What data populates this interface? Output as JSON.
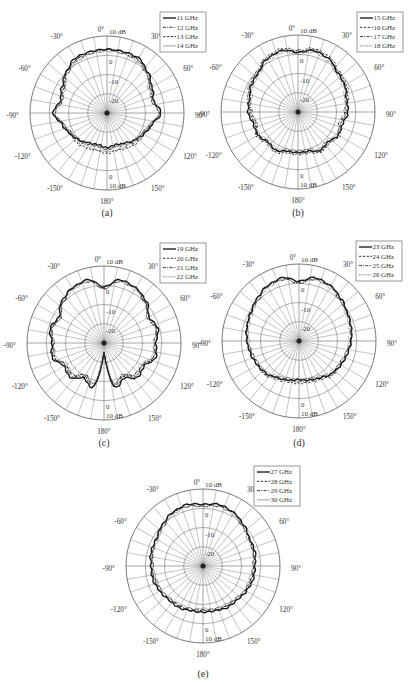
{
  "figure": {
    "panels": [
      "a",
      "b",
      "c",
      "d",
      "e"
    ]
  },
  "chart_data": [
    {
      "type": "polar-line",
      "panel": "(a)",
      "title": "",
      "radial_unit": "dB",
      "radial_ticks": [
        "-20",
        "-10",
        "0",
        "10 dB"
      ],
      "radial_range": [
        -30,
        10
      ],
      "angle_labels": [
        "0°",
        "30°",
        "60°",
        "90°",
        "120°",
        "150°",
        "180°",
        "-150°",
        "-120°",
        "-90°",
        "-60°",
        "-30°"
      ],
      "legend_position": "top-right",
      "angles_deg": [
        0,
        15,
        30,
        45,
        60,
        75,
        90,
        105,
        120,
        135,
        150,
        165,
        180,
        195,
        210,
        225,
        240,
        255,
        270,
        285,
        300,
        315,
        330,
        345
      ],
      "series": [
        {
          "name": "11 GHz",
          "style": "solid",
          "values": [
            3,
            3,
            3,
            0,
            -3,
            -5,
            -2,
            -6,
            -8,
            -10,
            -12,
            -13,
            -12,
            -13,
            -12,
            -10,
            -8,
            -6,
            -2,
            -5,
            -3,
            0,
            3,
            3
          ]
        },
        {
          "name": "12 GHz",
          "style": "dashdot",
          "values": [
            3,
            3,
            2,
            0,
            -4,
            -5,
            -2,
            -7,
            -9,
            -9,
            -11,
            -12,
            -11,
            -12,
            -11,
            -9,
            -9,
            -7,
            -2,
            -5,
            -4,
            0,
            2,
            3
          ]
        },
        {
          "name": "13 GHz",
          "style": "dashed",
          "values": [
            3,
            2,
            2,
            -1,
            -4,
            -6,
            -3,
            -6,
            -8,
            -8,
            -9,
            -10,
            -9,
            -10,
            -9,
            -8,
            -8,
            -6,
            -3,
            -6,
            -4,
            -1,
            2,
            2
          ]
        },
        {
          "name": "14 GHz",
          "style": "thin",
          "values": [
            2,
            2,
            1,
            -1,
            -5,
            -6,
            -3,
            -7,
            -9,
            -10,
            -12,
            -12,
            -11,
            -12,
            -12,
            -10,
            -9,
            -7,
            -3,
            -6,
            -5,
            -1,
            1,
            2
          ]
        }
      ]
    },
    {
      "type": "polar-line",
      "panel": "(b)",
      "radial_unit": "dB",
      "radial_ticks": [
        "-20",
        "-10",
        "0",
        "10 dB"
      ],
      "radial_range": [
        -30,
        10
      ],
      "angle_labels": [
        "0°",
        "30°",
        "60°",
        "90°",
        "120°",
        "150°",
        "180°",
        "-150°",
        "-120°",
        "-90°",
        "-60°",
        "-30°"
      ],
      "legend_position": "top-right",
      "angles_deg": [
        0,
        15,
        30,
        45,
        60,
        75,
        90,
        105,
        120,
        135,
        150,
        165,
        180,
        195,
        210,
        225,
        240,
        255,
        270,
        285,
        300,
        315,
        330,
        345
      ],
      "series": [
        {
          "name": "15 GHz",
          "style": "solid",
          "values": [
            1,
            3,
            2,
            -1,
            -2,
            -4,
            -4,
            -6,
            -6,
            -8,
            -7,
            -9,
            -9,
            -9,
            -7,
            -8,
            -6,
            -6,
            -4,
            -4,
            -2,
            -1,
            2,
            3
          ]
        },
        {
          "name": "16 GHz",
          "style": "dashed",
          "values": [
            2,
            4,
            3,
            0,
            -1,
            -3,
            -5,
            -7,
            -5,
            -7,
            -6,
            -8,
            -8,
            -8,
            -6,
            -7,
            -5,
            -7,
            -5,
            -3,
            -1,
            0,
            3,
            4
          ]
        },
        {
          "name": "17 GHz",
          "style": "dashdot",
          "values": [
            1,
            3,
            2,
            -1,
            -2,
            -4,
            -6,
            -8,
            -6,
            -8,
            -7,
            -9,
            -9,
            -9,
            -7,
            -8,
            -6,
            -8,
            -6,
            -4,
            -2,
            -1,
            2,
            3
          ]
        },
        {
          "name": "18 GHz",
          "style": "dotted",
          "values": [
            0,
            2,
            1,
            -2,
            -3,
            -5,
            -5,
            -7,
            -7,
            -9,
            -8,
            -10,
            -10,
            -10,
            -8,
            -9,
            -7,
            -7,
            -5,
            -5,
            -3,
            -2,
            1,
            2
          ]
        }
      ]
    },
    {
      "type": "polar-line",
      "panel": "(c)",
      "radial_unit": "dB",
      "radial_ticks": [
        "-20",
        "-10",
        "0",
        "10 dB"
      ],
      "radial_range": [
        -30,
        10
      ],
      "angle_labels": [
        "0°",
        "30°",
        "60°",
        "90°",
        "120°",
        "150°",
        "180°",
        "-150°",
        "-120°",
        "-90°",
        "-60°",
        "-30°"
      ],
      "legend_position": "top-right",
      "angles_deg": [
        0,
        15,
        30,
        45,
        60,
        75,
        90,
        105,
        120,
        135,
        150,
        165,
        180,
        195,
        210,
        225,
        240,
        255,
        270,
        285,
        300,
        315,
        330,
        345
      ],
      "series": [
        {
          "name": "19 GHz",
          "style": "solid",
          "values": [
            -1,
            4,
            3,
            1,
            -3,
            -1,
            -3,
            -2,
            -6,
            -5,
            -9,
            -6,
            -25,
            -6,
            -9,
            -5,
            -6,
            -2,
            -3,
            -1,
            -3,
            1,
            3,
            4
          ]
        },
        {
          "name": "20 GHz",
          "style": "dashed",
          "values": [
            -1,
            4,
            3,
            0,
            -3,
            -2,
            -3,
            -3,
            -7,
            -6,
            -10,
            -7,
            -25,
            -7,
            -10,
            -6,
            -7,
            -3,
            -3,
            -2,
            -3,
            0,
            3,
            4
          ]
        },
        {
          "name": "21 GHz",
          "style": "dashdot",
          "values": [
            -2,
            3,
            3,
            0,
            -4,
            -2,
            -4,
            -3,
            -7,
            -7,
            -11,
            -8,
            -25,
            -8,
            -11,
            -7,
            -7,
            -3,
            -4,
            -2,
            -4,
            0,
            3,
            3
          ]
        },
        {
          "name": "22 GHz",
          "style": "dotted",
          "values": [
            -2,
            3,
            2,
            0,
            -4,
            -2,
            -4,
            -4,
            -8,
            -7,
            -11,
            -8,
            -25,
            -8,
            -11,
            -7,
            -8,
            -4,
            -4,
            -2,
            -4,
            0,
            2,
            3
          ]
        }
      ]
    },
    {
      "type": "polar-line",
      "panel": "(d)",
      "radial_unit": "dB",
      "radial_ticks": [
        "-20",
        "-10",
        "0",
        "10 dB"
      ],
      "radial_range": [
        -30,
        10
      ],
      "angle_labels": [
        "0°",
        "30°",
        "60°",
        "90°",
        "120°",
        "150°",
        "180°",
        "-150°",
        "-120°",
        "-90°",
        "-60°",
        "-30°"
      ],
      "legend_position": "top-right",
      "angles_deg": [
        0,
        15,
        30,
        45,
        60,
        75,
        90,
        105,
        120,
        135,
        150,
        165,
        180,
        195,
        210,
        225,
        240,
        255,
        270,
        285,
        300,
        315,
        330,
        345
      ],
      "series": [
        {
          "name": "23 GHz",
          "style": "solid",
          "values": [
            1,
            4,
            3,
            1,
            -1,
            -2,
            -3,
            -4,
            -5,
            -6,
            -8,
            -9,
            -10,
            -9,
            -8,
            -6,
            -5,
            -4,
            -3,
            -2,
            -1,
            1,
            3,
            4
          ]
        },
        {
          "name": "24 GHz",
          "style": "dashed",
          "values": [
            1,
            4,
            3,
            1,
            -1,
            -2,
            -3,
            -4,
            -5,
            -5,
            -7,
            -8,
            -8,
            -8,
            -7,
            -5,
            -5,
            -4,
            -3,
            -2,
            -1,
            1,
            3,
            4
          ]
        },
        {
          "name": "25 GHz",
          "style": "dashdot",
          "values": [
            0,
            3,
            3,
            0,
            -1,
            -2,
            -3,
            -5,
            -6,
            -6,
            -8,
            -9,
            -9,
            -9,
            -8,
            -6,
            -6,
            -5,
            -3,
            -2,
            -1,
            0,
            3,
            3
          ]
        },
        {
          "name": "26 GHz",
          "style": "dotted",
          "values": [
            0,
            3,
            2,
            0,
            -2,
            -3,
            -4,
            -5,
            -6,
            -7,
            -9,
            -10,
            -10,
            -10,
            -9,
            -7,
            -6,
            -5,
            -4,
            -3,
            -2,
            0,
            2,
            3
          ]
        }
      ]
    },
    {
      "type": "polar-line",
      "panel": "(e)",
      "radial_unit": "dB",
      "radial_ticks": [
        "-20",
        "-10",
        "0",
        "10 dB"
      ],
      "radial_range": [
        -30,
        10
      ],
      "angle_labels": [
        "0°",
        "30°",
        "60°",
        "90°",
        "120°",
        "150°",
        "180°",
        "-150°",
        "-120°",
        "-90°",
        "-60°",
        "-30°"
      ],
      "legend_position": "top-right",
      "angles_deg": [
        0,
        15,
        30,
        45,
        60,
        75,
        90,
        105,
        120,
        135,
        150,
        165,
        180,
        195,
        210,
        225,
        240,
        255,
        270,
        285,
        300,
        315,
        330,
        345
      ],
      "series": [
        {
          "name": "27 GHz",
          "style": "solid",
          "values": [
            2,
            3,
            2,
            0,
            -2,
            -2,
            -3,
            -3,
            -4,
            -5,
            -5,
            -6,
            -6,
            -6,
            -5,
            -5,
            -4,
            -3,
            -3,
            -2,
            -2,
            0,
            2,
            3
          ]
        },
        {
          "name": "28 GHz",
          "style": "dashed",
          "values": [
            2,
            3,
            2,
            0,
            -2,
            -3,
            -3,
            -4,
            -4,
            -5,
            -6,
            -6,
            -7,
            -6,
            -6,
            -5,
            -4,
            -4,
            -3,
            -3,
            -2,
            0,
            2,
            3
          ]
        },
        {
          "name": "29 GHz",
          "style": "dashdot",
          "values": [
            1,
            2,
            2,
            -1,
            -2,
            -3,
            -4,
            -4,
            -5,
            -6,
            -6,
            -7,
            -7,
            -7,
            -6,
            -6,
            -5,
            -4,
            -4,
            -3,
            -2,
            -1,
            2,
            2
          ]
        },
        {
          "name": "30 GHz",
          "style": "thin",
          "values": [
            1,
            2,
            1,
            -1,
            -3,
            -3,
            -4,
            -5,
            -5,
            -6,
            -7,
            -7,
            -8,
            -7,
            -7,
            -6,
            -5,
            -5,
            -4,
            -3,
            -3,
            -1,
            1,
            2
          ]
        }
      ]
    }
  ],
  "layout": {
    "panels": [
      {
        "id": "a",
        "cx": 107,
        "cy": 113,
        "r": 77,
        "legend": {
          "x": 160,
          "y": 12,
          "w": 46,
          "h": 40
        },
        "caption_y": 216,
        "caption": "(a)"
      },
      {
        "id": "b",
        "cx": 298,
        "cy": 112,
        "r": 77,
        "legend": {
          "x": 357,
          "y": 12,
          "w": 46,
          "h": 40
        },
        "caption": "(b)",
        "caption_y": 216
      },
      {
        "id": "c",
        "cx": 104,
        "cy": 343,
        "r": 77,
        "legend": {
          "x": 160,
          "y": 243,
          "w": 46,
          "h": 40
        },
        "caption": "(c)",
        "caption_y": 446
      },
      {
        "id": "d",
        "cx": 299,
        "cy": 341,
        "r": 77,
        "legend": {
          "x": 356,
          "y": 241,
          "w": 46,
          "h": 40
        },
        "caption": "(d)",
        "caption_y": 446
      },
      {
        "id": "e",
        "cx": 203,
        "cy": 566,
        "r": 77,
        "legend": {
          "x": 254,
          "y": 466,
          "w": 46,
          "h": 40
        },
        "caption": "(e)",
        "caption_y": 677
      }
    ]
  }
}
